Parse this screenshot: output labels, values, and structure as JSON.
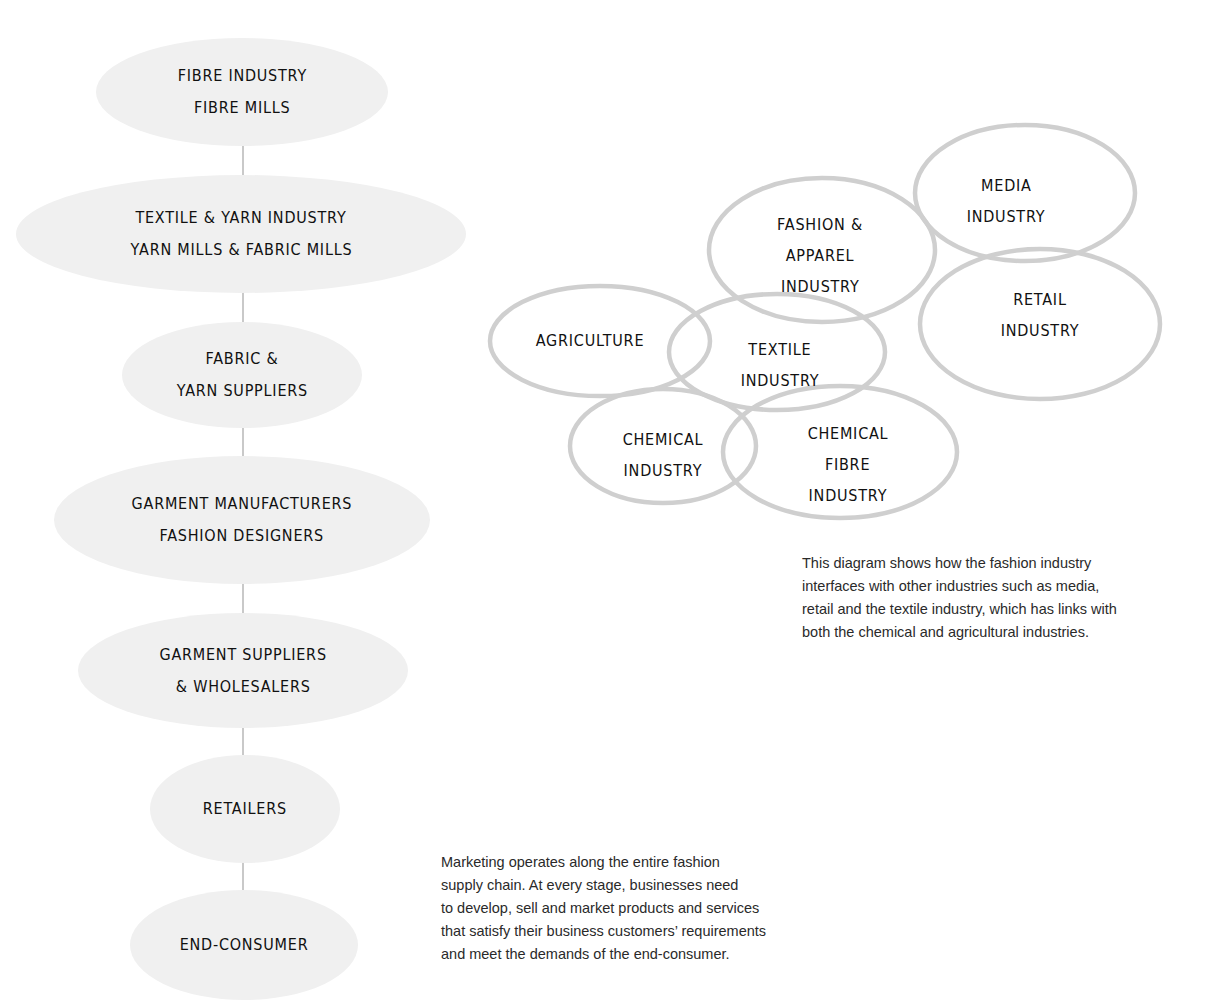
{
  "supply_chain": {
    "nodes": [
      {
        "lines": [
          "FIBRE INDUSTRY",
          "FIBRE MILLS"
        ]
      },
      {
        "lines": [
          "TEXTILE & YARN INDUSTRY",
          "YARN MILLS & FABRIC MILLS"
        ]
      },
      {
        "lines": [
          "FABRIC &",
          "YARN SUPPLIERS"
        ]
      },
      {
        "lines": [
          "GARMENT MANUFACTURERS",
          "FASHION DESIGNERS"
        ]
      },
      {
        "lines": [
          "GARMENT SUPPLIERS",
          "& WHOLESALERS"
        ]
      },
      {
        "lines": [
          "RETAILERS"
        ]
      },
      {
        "lines": [
          "END-CONSUMER"
        ]
      }
    ],
    "fill_color": "#f0f0f0",
    "connector_color": "#c9c9c9"
  },
  "industry_venn": {
    "outline_color": "#cfcfcf",
    "circles": [
      {
        "id": "agriculture",
        "lines": [
          "AGRICULTURE"
        ]
      },
      {
        "id": "textile",
        "lines": [
          "TEXTILE",
          "INDUSTRY"
        ]
      },
      {
        "id": "fashion-apparel",
        "lines": [
          "FASHION &",
          "APPAREL",
          "INDUSTRY"
        ]
      },
      {
        "id": "media",
        "lines": [
          "MEDIA",
          "INDUSTRY"
        ]
      },
      {
        "id": "retail",
        "lines": [
          "RETAIL",
          "INDUSTRY"
        ]
      },
      {
        "id": "chemical",
        "lines": [
          "CHEMICAL",
          "INDUSTRY"
        ]
      },
      {
        "id": "chemical-fibre",
        "lines": [
          "CHEMICAL",
          "FIBRE",
          "INDUSTRY"
        ]
      }
    ]
  },
  "captions": {
    "venn_caption": [
      "This diagram shows how the fashion industry",
      "interfaces with other industries such as media,",
      "retail and the textile industry, which has links with",
      "both the chemical and agricultural industries."
    ],
    "chain_caption": [
      "Marketing operates along the entire fashion",
      "supply chain. At every stage, businesses need",
      "to develop, sell and market products and services",
      "that satisfy their business customers’ requirements",
      "and meet the demands of the end-consumer."
    ]
  }
}
